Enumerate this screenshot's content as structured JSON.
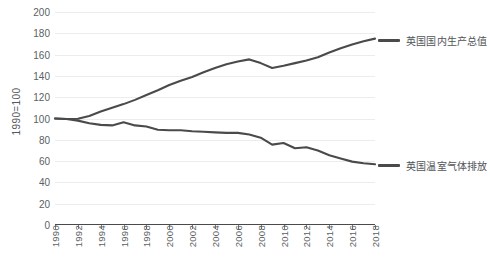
{
  "chart_data": {
    "type": "line",
    "title": "",
    "xlabel": "",
    "ylabel": "1990=100",
    "ylim": [
      0,
      200
    ],
    "xlim": [
      1990,
      2018
    ],
    "ytick_step": 20,
    "xtick_step": 2,
    "grid": true,
    "legend_position": "right",
    "yticks": [
      "200",
      "180",
      "160",
      "140",
      "120",
      "100",
      "80",
      "60",
      "40",
      "20",
      "0"
    ],
    "xticks": [
      "1990",
      "1992",
      "1994",
      "1996",
      "1998",
      "2000",
      "2002",
      "2004",
      "2006",
      "2008",
      "2010",
      "2012",
      "2014",
      "2016",
      "2018"
    ],
    "x": [
      1990,
      1991,
      1992,
      1993,
      1994,
      1995,
      1996,
      1997,
      1998,
      1999,
      2000,
      2001,
      2002,
      2003,
      2004,
      2005,
      2006,
      2007,
      2008,
      2009,
      2010,
      2011,
      2012,
      2013,
      2014,
      2015,
      2016,
      2017,
      2018
    ],
    "series": [
      {
        "name": "英国国内生产总值",
        "color": "#4a4a4a",
        "values": [
          100,
          99.5,
          99.8,
          102.3,
          106.5,
          110,
          113.5,
          117.5,
          122,
          126.5,
          131.5,
          135.5,
          139,
          143.5,
          147.5,
          151,
          153.5,
          155.5,
          152,
          147.5,
          149.5,
          152,
          154.5,
          157.5,
          162,
          166,
          169.5,
          172.5,
          175
        ]
      },
      {
        "name": "英国温室气体排放",
        "color": "#4a4a4a",
        "values": [
          100,
          99.5,
          98,
          95.5,
          94,
          93.5,
          96.5,
          93.5,
          92.5,
          89.5,
          89,
          89,
          88,
          87.5,
          87,
          86.5,
          86.5,
          85,
          82,
          75.5,
          77,
          72,
          73,
          70,
          65.5,
          62.5,
          59.5,
          58,
          57
        ]
      }
    ]
  },
  "legend": {
    "items": [
      {
        "label": "英国国内生产总值",
        "color": "#4a4a4a"
      },
      {
        "label": "英国温室气体排放",
        "color": "#4a4a4a"
      }
    ]
  },
  "axes": {
    "y_title": "1990=100"
  }
}
